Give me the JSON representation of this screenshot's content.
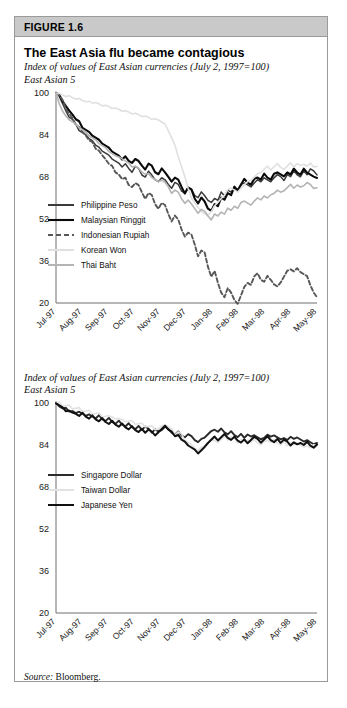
{
  "figure": {
    "number_label": "FIGURE 1.6",
    "title": "The East Asia flu became contagious",
    "source_label": "Source:",
    "source_value": "Bloomberg."
  },
  "panel1": {
    "subtitle_line1": "Index of values of East Asian currencies (July 2, 1997=100)",
    "subtitle_line2": "East Asian 5"
  },
  "panel2": {
    "subtitle_line1": "Index of values of East Asian currencies (July 2, 1997=100)",
    "subtitle_line2": "East Asian 5"
  },
  "chart_data": [
    {
      "type": "line",
      "id": "east-asian-5-top",
      "title": "Index of values of East Asian currencies (July 2, 1997=100)",
      "subtitle": "East Asian 5",
      "xlabel": "",
      "ylabel": "",
      "ylim": [
        20,
        100
      ],
      "yticks": [
        20,
        36,
        52,
        68,
        84,
        100
      ],
      "grid": false,
      "legend_position": "center-left",
      "x": [
        "Jul-97",
        "Aug-97",
        "Sep-97",
        "Oct-97",
        "Nov-97",
        "Dec-97",
        "Jan-98",
        "Feb-98",
        "Mar-98",
        "Apr-98",
        "May-98"
      ],
      "series": [
        {
          "name": "Philippine Peso",
          "color": "#3a3a3a",
          "style": "solid",
          "width": 1.5,
          "values": [
            100,
            99,
            96,
            93,
            91,
            90,
            88,
            86,
            85,
            84,
            83,
            82,
            80,
            79,
            78,
            77,
            76,
            75,
            74,
            73,
            72,
            73,
            71,
            70,
            72,
            71,
            69,
            68,
            70,
            69,
            67,
            66,
            68,
            67,
            65,
            64,
            66,
            65,
            63,
            62,
            64,
            63,
            61,
            60,
            62,
            61,
            59,
            58,
            60,
            59,
            62,
            61,
            63,
            62,
            64,
            63,
            65,
            66,
            65,
            64,
            66,
            67,
            66,
            68,
            67,
            66,
            68,
            69,
            68,
            67,
            69,
            68,
            70,
            69,
            68,
            70,
            69,
            71,
            70,
            69
          ]
        },
        {
          "name": "Malaysian Ringgit",
          "color": "#0a0a0a",
          "style": "solid",
          "width": 2.1,
          "values": [
            100,
            99,
            97,
            95,
            93,
            92,
            90,
            89,
            87,
            86,
            85,
            84,
            83,
            82,
            81,
            80,
            79,
            78,
            77,
            76,
            75,
            76,
            74,
            73,
            75,
            74,
            72,
            71,
            73,
            72,
            70,
            69,
            71,
            70,
            68,
            66,
            68,
            67,
            64,
            62,
            64,
            63,
            60,
            58,
            60,
            59,
            56,
            55,
            58,
            57,
            60,
            59,
            62,
            61,
            64,
            63,
            65,
            67,
            66,
            65,
            67,
            68,
            67,
            69,
            68,
            67,
            69,
            70,
            69,
            68,
            70,
            69,
            71,
            70,
            69,
            71,
            70,
            69,
            68,
            68
          ]
        },
        {
          "name": "Indonesian Rupiah",
          "color": "#585858",
          "style": "dashed",
          "width": 1.9,
          "values": [
            100,
            99,
            97,
            94,
            92,
            90,
            88,
            87,
            85,
            84,
            82,
            81,
            79,
            78,
            76,
            75,
            73,
            72,
            70,
            69,
            67,
            68,
            65,
            64,
            66,
            65,
            62,
            60,
            62,
            61,
            58,
            56,
            58,
            57,
            54,
            51,
            53,
            52,
            48,
            45,
            47,
            46,
            42,
            38,
            40,
            39,
            34,
            30,
            32,
            28,
            24,
            22,
            26,
            24,
            21,
            20,
            23,
            26,
            28,
            27,
            30,
            31,
            29,
            28,
            30,
            29,
            27,
            26,
            28,
            30,
            32,
            33,
            32,
            33,
            32,
            31,
            30,
            27,
            24,
            22
          ]
        },
        {
          "name": "Korean Won",
          "color": "#e0e0e0",
          "style": "solid",
          "width": 1.6,
          "values": [
            100,
            100,
            99,
            99,
            99,
            98,
            98,
            98,
            97,
            97,
            97,
            96,
            96,
            96,
            95,
            95,
            95,
            94,
            94,
            94,
            93,
            93,
            93,
            92,
            92,
            92,
            91,
            91,
            91,
            90,
            90,
            90,
            89,
            88,
            86,
            83,
            80,
            76,
            72,
            68,
            64,
            60,
            58,
            56,
            55,
            54,
            53,
            55,
            57,
            58,
            60,
            61,
            63,
            64,
            63,
            62,
            64,
            65,
            66,
            67,
            68,
            69,
            70,
            71,
            72,
            71,
            72,
            73,
            72,
            71,
            72,
            73,
            72,
            73,
            72,
            73,
            72,
            73,
            72,
            72
          ]
        },
        {
          "name": "Thai Baht",
          "color": "#b4b4b4",
          "style": "solid",
          "width": 1.6,
          "values": [
            100,
            96,
            93,
            91,
            90,
            89,
            88,
            87,
            86,
            85,
            84,
            83,
            82,
            81,
            80,
            79,
            78,
            77,
            76,
            76,
            75,
            74,
            73,
            72,
            72,
            71,
            70,
            69,
            69,
            68,
            67,
            66,
            67,
            66,
            64,
            62,
            63,
            62,
            60,
            58,
            59,
            58,
            56,
            54,
            56,
            55,
            53,
            52,
            54,
            53,
            55,
            54,
            56,
            55,
            57,
            56,
            58,
            59,
            58,
            57,
            59,
            60,
            59,
            61,
            60,
            61,
            62,
            63,
            62,
            63,
            64,
            65,
            64,
            65,
            64,
            65,
            66,
            65,
            64,
            64
          ]
        }
      ]
    },
    {
      "type": "line",
      "id": "east-asian-3-bottom",
      "title": "Index of values of East Asian currencies (July 2, 1997=100)",
      "subtitle": "East Asian 5",
      "xlabel": "",
      "ylabel": "",
      "ylim": [
        20,
        100
      ],
      "yticks": [
        20,
        36,
        52,
        68,
        84,
        100
      ],
      "grid": false,
      "legend_position": "center-left",
      "x": [
        "Jul-97",
        "Aug-97",
        "Sep-97",
        "Oct-97",
        "Nov-97",
        "Dec-97",
        "Jan-98",
        "Feb-98",
        "Mar-98",
        "Apr-98",
        "May-98"
      ],
      "series": [
        {
          "name": "Singapore Dollar",
          "color": "#2b2b2b",
          "style": "solid",
          "width": 1.9,
          "values": [
            100,
            99,
            98,
            98,
            97,
            97,
            96,
            97,
            96,
            95,
            96,
            95,
            94,
            95,
            94,
            93,
            94,
            93,
            92,
            93,
            92,
            91,
            92,
            91,
            90,
            91,
            90,
            91,
            90,
            89,
            90,
            89,
            90,
            91,
            90,
            89,
            88,
            89,
            88,
            87,
            88,
            87,
            86,
            85,
            86,
            87,
            88,
            89,
            90,
            89,
            90,
            89,
            88,
            89,
            88,
            87,
            88,
            87,
            88,
            87,
            88,
            87,
            86,
            87,
            88,
            87,
            88,
            87,
            86,
            87,
            86,
            87,
            86,
            87,
            86,
            85,
            86,
            85,
            84,
            85
          ]
        },
        {
          "name": "Taiwan Dollar",
          "color": "#e2e2e2",
          "style": "solid",
          "width": 1.6,
          "values": [
            100,
            100,
            99,
            99,
            99,
            98,
            98,
            98,
            97,
            97,
            97,
            96,
            96,
            96,
            95,
            95,
            95,
            95,
            94,
            94,
            94,
            93,
            93,
            93,
            92,
            92,
            92,
            91,
            91,
            91,
            90,
            90,
            91,
            92,
            91,
            90,
            88,
            89,
            88,
            86,
            85,
            84,
            83,
            82,
            83,
            84,
            85,
            86,
            86,
            85,
            86,
            87,
            86,
            87,
            86,
            85,
            86,
            85,
            86,
            85,
            86,
            85,
            84,
            85,
            86,
            85,
            86,
            85,
            84,
            85,
            84,
            85,
            84,
            85,
            84,
            83,
            84,
            83,
            84,
            84
          ]
        },
        {
          "name": "Japanese Yen",
          "color": "#111111",
          "style": "solid",
          "width": 2.0,
          "values": [
            100,
            99,
            98,
            97,
            97,
            96,
            96,
            95,
            96,
            95,
            94,
            95,
            94,
            93,
            94,
            93,
            92,
            93,
            92,
            91,
            92,
            91,
            90,
            91,
            90,
            89,
            90,
            89,
            90,
            89,
            88,
            89,
            90,
            91,
            90,
            89,
            87,
            88,
            86,
            85,
            84,
            83,
            82,
            81,
            82,
            83,
            85,
            86,
            87,
            86,
            87,
            88,
            87,
            86,
            87,
            86,
            85,
            86,
            85,
            86,
            87,
            86,
            85,
            86,
            87,
            86,
            85,
            86,
            85,
            86,
            85,
            84,
            85,
            84,
            85,
            84,
            85,
            84,
            83,
            84
          ]
        }
      ]
    }
  ]
}
